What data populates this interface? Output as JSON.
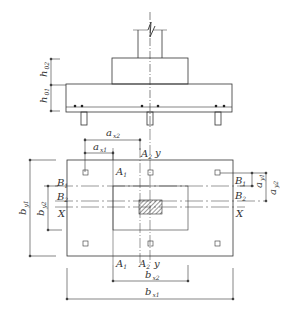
{
  "elevation": {
    "labels": {
      "h_upper": "h",
      "h_upper_sub": "02",
      "h_lower": "h",
      "h_lower_sub": "01"
    }
  },
  "plan": {
    "labels": {
      "a_x2": "a",
      "a_x2_sub": "x2",
      "a_x1": "a",
      "a_x1_sub": "x1",
      "A1_top": "A",
      "A1_top_sub": "1",
      "A2_top": "A",
      "A2_top_sub": "2",
      "y_top": "y",
      "B1_left": "B",
      "B1_left_sub": "1",
      "B2_left": "B",
      "B2_left_sub": "2",
      "X_left": "X",
      "B1_right": "B",
      "B1_right_sub": "1",
      "B2_right": "B",
      "B2_right_sub": "2",
      "X_right": "X",
      "a_y1": "a",
      "a_y1_sub": "y1",
      "a_y2": "a",
      "a_y2_sub": "y2",
      "b_y1": "b",
      "b_y1_sub": "y1",
      "b_y2": "b",
      "b_y2_sub": "y2",
      "A1_bot": "A",
      "A1_bot_sub": "1",
      "A2_bot": "A",
      "A2_bot_sub": "2",
      "y_bot": "y",
      "b_x2": "b",
      "b_x2_sub": "x2",
      "b_x1": "b",
      "b_x1_sub": "x1"
    }
  },
  "colors": {
    "line": "#333333",
    "light": "#666666"
  }
}
